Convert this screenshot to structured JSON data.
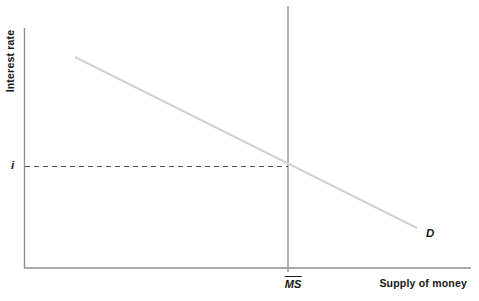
{
  "figure": {
    "width": 479,
    "height": 301,
    "background": "#ffffff",
    "axis_color": "#919191",
    "text_color": "#161616",
    "lines": [
      {
        "name": "y-axis",
        "x1": 24.5,
        "y1": 28,
        "x2": 24.5,
        "y2": 268,
        "color": "#919191",
        "width": 1.4,
        "dash": ""
      },
      {
        "name": "x-axis",
        "x1": 24,
        "y1": 268,
        "x2": 471,
        "y2": 268,
        "color": "#919191",
        "width": 1.4,
        "dash": ""
      },
      {
        "name": "money-supply-line",
        "x1": 288,
        "y1": 6,
        "x2": 288,
        "y2": 272,
        "color": "#8c8c8c",
        "width": 1.3,
        "dash": ""
      },
      {
        "name": "money-demand-line",
        "x1": 75,
        "y1": 57,
        "x2": 417,
        "y2": 228,
        "color": "#d7d3cc",
        "width": 2,
        "dash": ""
      },
      {
        "name": "equilibrium-rate-dashed-line",
        "x1": 25,
        "y1": 166.5,
        "x2": 288,
        "y2": 166.5,
        "color": "#4e4e4e",
        "width": 1.2,
        "dash": "5,4"
      }
    ]
  },
  "labels": {
    "ylabel": "Interest rate",
    "xlabel": "Supply of money",
    "equilibrium_rate": "i",
    "supply_curve": "MS",
    "demand_curve": "D"
  },
  "chart_data": {
    "type": "line",
    "title": "",
    "xlabel": "Supply of money",
    "ylabel": "Interest rate",
    "grid": false,
    "legend_position": "none",
    "axes_numeric": false,
    "series": [
      {
        "name": "money supply",
        "label": "MS (with overbar)",
        "shape": "vertical line (perfectly inelastic money supply)",
        "color": "#8c8c8c",
        "points_frac": [
          [
            0.59,
            0.0
          ],
          [
            0.59,
            1.0
          ]
        ]
      },
      {
        "name": "money demand",
        "label": "D",
        "shape": "straight downward-sloping line",
        "color": "#d7d3cc",
        "points_frac": [
          [
            0.11,
            0.12
          ],
          [
            0.88,
            0.83
          ]
        ]
      }
    ],
    "annotations": [
      {
        "label": "i",
        "kind": "dashed horizontal guide from y-axis to MS line",
        "y_frac": 0.58,
        "meaning": "equilibrium interest rate at intersection of D and MS"
      }
    ]
  }
}
